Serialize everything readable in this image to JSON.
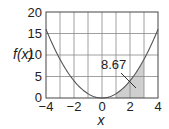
{
  "chart_data": {
    "type": "area",
    "title": "",
    "function": "f(x) = x^2",
    "xlabel": "x",
    "ylabel": "f(x)",
    "xlim": [
      -4,
      4
    ],
    "ylim": [
      0,
      20
    ],
    "x_ticks": [
      -4,
      -2,
      0,
      2,
      4
    ],
    "y_ticks": [
      0,
      5,
      10,
      15,
      20
    ],
    "grid": true,
    "grid_x_step": 1,
    "grid_y_step": 5,
    "series": [
      {
        "name": "f(x)",
        "x": [
          -4,
          -3,
          -2,
          -1,
          0,
          1,
          2,
          3,
          4
        ],
        "values": [
          16,
          9,
          4,
          1,
          0,
          1,
          4,
          9,
          16
        ]
      }
    ],
    "shaded_region": {
      "x_from": 1,
      "x_to": 3,
      "area": 8.67
    },
    "annotations": [
      {
        "text": "8.67",
        "points_to": [
          2.4,
          3
        ]
      }
    ],
    "legend": "none"
  },
  "labels": {
    "xlabel": "x",
    "ylabel": "f(x)",
    "annotation": "8.67",
    "x_ticks": [
      "−4",
      "−2",
      "0",
      "2",
      "4"
    ],
    "y_ticks": [
      "0",
      "5",
      "10",
      "15",
      "20"
    ]
  },
  "colors": {
    "curve": "#555555",
    "grid": "#888888",
    "shade": "#cfcfcf",
    "axis": "#444444"
  }
}
